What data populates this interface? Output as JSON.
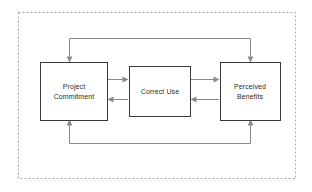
{
  "figure": {
    "background_color": "#ffffff",
    "frame": {
      "style": "dashed",
      "color": "#a8a8a8",
      "x": 18,
      "y": 12,
      "width": 277,
      "height": 166
    },
    "box_stroke_color": "#3a3a3a",
    "box_fill_color": "#ffffff",
    "arrow_color": "#8a8a8a",
    "text_color": "#2b2b2b"
  },
  "nodes": [
    {
      "id": "project-commitment",
      "label_lines": [
        "Project",
        "Commitment"
      ],
      "label": "Project Commitment",
      "x": 40,
      "y": 62,
      "width": 67,
      "height": 58
    },
    {
      "id": "correct-use",
      "label_lines": [
        "Correct Use"
      ],
      "label": "Correct Use",
      "x": 129,
      "y": 66,
      "width": 61,
      "height": 50
    },
    {
      "id": "perceived-benefits",
      "label_lines": [
        "Perceived",
        "Benefits"
      ],
      "label": "Perceived Benefits",
      "x": 220,
      "y": 62,
      "width": 60,
      "height": 58
    }
  ],
  "edges": [
    {
      "id": "commitment-to-use",
      "from": "project-commitment",
      "to": "correct-use",
      "direction": "right",
      "kind": "straight-horizontal"
    },
    {
      "id": "use-to-commitment",
      "from": "correct-use",
      "to": "project-commitment",
      "direction": "left",
      "kind": "straight-horizontal"
    },
    {
      "id": "use-to-benefits",
      "from": "correct-use",
      "to": "perceived-benefits",
      "direction": "right",
      "kind": "straight-horizontal"
    },
    {
      "id": "benefits-to-use",
      "from": "perceived-benefits",
      "to": "correct-use",
      "direction": "left",
      "kind": "straight-horizontal"
    },
    {
      "id": "top-feedback-loop",
      "from": "perceived-benefits",
      "to": "project-commitment",
      "direction": "down-into-both",
      "kind": "routed-above"
    },
    {
      "id": "bottom-feedback-loop",
      "from": "project-commitment",
      "to": "perceived-benefits",
      "direction": "up-into-both",
      "kind": "routed-below"
    }
  ]
}
